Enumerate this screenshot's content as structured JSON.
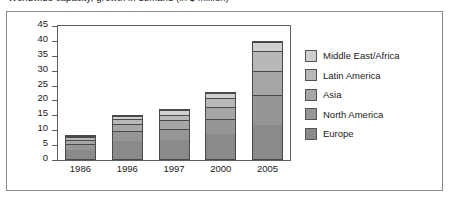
{
  "figure": {
    "title_clipped": "Worldwide capacity, growth in demand (in $ million)"
  },
  "chart_data": {
    "type": "bar",
    "stacked": true,
    "title": "",
    "xlabel": "",
    "ylabel": "",
    "ylim": [
      0,
      45
    ],
    "ytick_step": 5,
    "yticks": [
      45,
      40,
      35,
      30,
      25,
      20,
      15,
      10,
      5,
      0
    ],
    "grid": false,
    "legend_position": "right",
    "categories": [
      "1986",
      "1996",
      "1997",
      "2000",
      "2005"
    ],
    "series": [
      {
        "name": "Europe",
        "color": "#8a8a8a",
        "values": [
          3.5,
          6.5,
          6.5,
          8.5,
          11.5
        ]
      },
      {
        "name": "North America",
        "color": "#969696",
        "values": [
          2.0,
          3.5,
          4.0,
          5.5,
          10.5
        ]
      },
      {
        "name": "Asia",
        "color": "#a6a6a6",
        "values": [
          1.5,
          2.5,
          3.0,
          4.0,
          8.0
        ]
      },
      {
        "name": "Latin America",
        "color": "#b8b8b8",
        "values": [
          1.0,
          1.5,
          2.0,
          3.0,
          7.0
        ]
      },
      {
        "name": "Middle East/Africa",
        "color": "#cfcfcf",
        "values": [
          0.5,
          1.0,
          1.5,
          2.0,
          3.0
        ]
      }
    ],
    "totals": [
      8.5,
      15.0,
      17.0,
      23.0,
      40.0
    ]
  },
  "colors": {
    "plot_border": "#5f5f5f",
    "figure_border": "#8a8a8a",
    "bar_outline": "#4a4a4a",
    "text": "#1a1a1a",
    "background": "#ffffff"
  }
}
